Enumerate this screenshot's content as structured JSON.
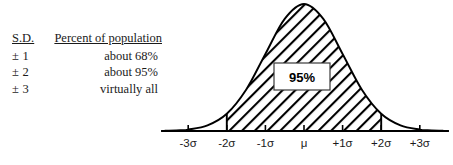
{
  "legend": {
    "headers": {
      "sd": "S.D.",
      "percent": "Percent of population"
    },
    "rows": [
      {
        "sd": "± 1",
        "percent": "about 68%"
      },
      {
        "sd": "± 2",
        "percent": "about 95%"
      },
      {
        "sd": "± 3",
        "percent": "virtually all"
      }
    ]
  },
  "chart_data": {
    "type": "area",
    "title": "",
    "xlabel": "",
    "ylabel": "",
    "curve": "normal-distribution-bell-curve",
    "tick_labels": [
      "-3σ",
      "-2σ",
      "-1σ",
      "μ",
      "+1σ",
      "+2σ",
      "+3σ"
    ],
    "tick_values": [
      -3,
      -2,
      -1,
      0,
      1,
      2,
      3
    ],
    "x": [
      -3.6,
      -3.2,
      -3,
      -2.5,
      -2,
      -1.5,
      -1,
      -0.5,
      0,
      0.5,
      1,
      1.5,
      2,
      2.5,
      3,
      3.2,
      3.6
    ],
    "y": [
      0.0006,
      0.0024,
      0.0044,
      0.0175,
      0.054,
      0.1295,
      0.242,
      0.3521,
      0.3989,
      0.3521,
      0.242,
      0.1295,
      0.054,
      0.0175,
      0.0044,
      0.0024,
      0.0006
    ],
    "shaded_region": {
      "from": -2,
      "to": 2,
      "fill": "diagonal-hatch",
      "label": "95%"
    },
    "callout_label": "95%",
    "axis_range": [
      -3.6,
      3.6
    ],
    "grid": false,
    "legend_position": "none",
    "colors": {
      "line": "#000000",
      "hatch": "#000000",
      "background": "#ffffff"
    }
  }
}
